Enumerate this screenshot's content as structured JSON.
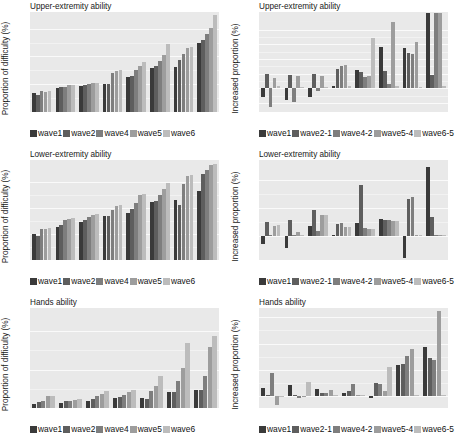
{
  "figure": {
    "panel_width": 229,
    "panel_height": 148,
    "series_colors_abs": [
      "#3a3a3a",
      "#5e5e5e",
      "#7e7e7e",
      "#9d9d9d",
      "#bcbcbc"
    ],
    "series_colors_diff": [
      "#3a3a3a",
      "#5e5e5e",
      "#7e7e7e",
      "#9d9d9d",
      "#bcbcbc"
    ],
    "plot_background": "#e9e9e9",
    "text_color": "#1a1a1a"
  },
  "chart_data": [
    {
      "id": "upper-extremity-proportion",
      "type": "bar",
      "title": "Upper-extremity ability",
      "xlabel": "",
      "ylabel": "Proportion of difficulty (%)",
      "ylim": [
        0,
        90
      ],
      "yticks": [
        0,
        25,
        50,
        75
      ],
      "grid": true,
      "legend_position": "bottom",
      "categories": [
        "50-55",
        "56-60",
        "61-65",
        "66-70",
        "71-75",
        "76-80",
        "81-85",
        "86-90"
      ],
      "series": [
        {
          "name": "wave1",
          "values": [
            17.0,
            22.0,
            23.5,
            25.0,
            31.5,
            39.5,
            40.5,
            62.0
          ]
        },
        {
          "name": "wave2",
          "values": [
            15.5,
            22.5,
            24.0,
            25.5,
            32.5,
            41.5,
            47.0,
            65.0
          ]
        },
        {
          "name": "wave4",
          "values": [
            18.5,
            22.5,
            25.5,
            35.0,
            37.5,
            45.5,
            52.0,
            70.0
          ]
        },
        {
          "name": "wave5",
          "values": [
            18.0,
            24.5,
            26.5,
            37.0,
            41.5,
            51.0,
            58.0,
            76.0
          ]
        },
        {
          "name": "wave6",
          "values": [
            18.5,
            24.5,
            26.5,
            37.5,
            45.0,
            61.0,
            58.5,
            87.0
          ]
        }
      ]
    },
    {
      "id": "upper-extremity-increase",
      "type": "bar",
      "title": "Upper-extremity ability",
      "xlabel": "",
      "ylabel": "Increased proportion (%)",
      "ylim": [
        -1.6,
        5.2
      ],
      "yticks": [
        -1,
        0,
        1,
        2,
        3,
        4
      ],
      "grid": true,
      "legend_position": "bottom",
      "categories": [
        "50-55",
        "56-60",
        "61-65",
        "66-70",
        "71-75",
        "76-80",
        "81-85",
        "86-90"
      ],
      "series": [
        {
          "name": "wave1",
          "values": [
            -0.55,
            -0.75,
            -0.6,
            0.15,
            1.25,
            2.85,
            2.75,
            5.15
          ]
        },
        {
          "name": "wave2-1",
          "values": [
            1.0,
            0.95,
            1.0,
            1.35,
            1.1,
            1.2,
            2.4,
            0.95
          ]
        },
        {
          "name": "wave4-2",
          "values": [
            -1.25,
            -0.95,
            -0.15,
            1.55,
            0.8,
            0.3,
            2.35,
            5.1
          ]
        },
        {
          "name": "wave5-4",
          "values": [
            0.7,
            0.85,
            0.85,
            1.6,
            0.85,
            4.55,
            3.15,
            5.15
          ]
        },
        {
          "name": "wave6-5",
          "values": [
            0.15,
            0.1,
            0.1,
            0.15,
            3.45,
            0.15,
            0.1,
            0.15
          ]
        }
      ]
    },
    {
      "id": "lower-extremity-proportion",
      "type": "bar",
      "title": "Lower-extremity ability",
      "xlabel": "",
      "ylabel": "Proportion of difficulty (%)",
      "ylim": [
        0,
        96
      ],
      "yticks": [
        0,
        25,
        50,
        75
      ],
      "grid": true,
      "legend_position": "bottom",
      "categories": [
        "50-55",
        "56-60",
        "61-65",
        "66-70",
        "71-75",
        "76-80",
        "81-85",
        "86-90"
      ],
      "series": [
        {
          "name": "wave1",
          "values": [
            25.0,
            32.0,
            36.5,
            42.5,
            45.5,
            55.5,
            58.0,
            66.5
          ]
        },
        {
          "name": "wave2",
          "values": [
            23.0,
            34.0,
            38.5,
            42.5,
            48.5,
            57.0,
            52.5,
            83.0
          ]
        },
        {
          "name": "wave4",
          "values": [
            29.5,
            38.5,
            41.5,
            48.0,
            55.0,
            62.0,
            72.5,
            86.5
          ]
        },
        {
          "name": "wave5",
          "values": [
            30.0,
            39.0,
            43.5,
            51.5,
            62.0,
            68.0,
            81.0,
            91.5
          ]
        },
        {
          "name": "wave6",
          "values": [
            30.5,
            40.0,
            44.0,
            52.5,
            63.0,
            73.5,
            81.5,
            92.0
          ]
        }
      ]
    },
    {
      "id": "lower-extremity-increase",
      "type": "bar",
      "title": "Lower-extremity ability",
      "xlabel": "",
      "ylabel": "Increased proportion (%)",
      "ylim": [
        -2.6,
        8.2
      ],
      "yticks": [
        0,
        3,
        6
      ],
      "grid": true,
      "legend_position": "bottom",
      "categories": [
        "50-55",
        "56-60",
        "61-65",
        "66-70",
        "71-75",
        "76-80",
        "81-85",
        "86-90"
      ],
      "series": [
        {
          "name": "wave1",
          "values": [
            -0.85,
            -1.25,
            1.1,
            0.15,
            1.4,
            1.8,
            -2.4,
            7.4
          ]
        },
        {
          "name": "wave2-1",
          "values": [
            1.55,
            1.75,
            2.75,
            1.25,
            5.5,
            1.7,
            4.0,
            2.1
          ]
        },
        {
          "name": "wave4-2",
          "values": [
            0.1,
            0.1,
            0.5,
            1.4,
            0.9,
            1.7,
            4.2,
            0.1
          ]
        },
        {
          "name": "wave5-4",
          "values": [
            1.1,
            0.45,
            2.3,
            1.0,
            0.8,
            1.65,
            0.1,
            0.1
          ]
        },
        {
          "name": "wave6-5",
          "values": [
            1.2,
            0.15,
            2.25,
            1.0,
            0.75,
            1.6,
            0.1,
            0.1
          ]
        }
      ]
    },
    {
      "id": "hands-proportion",
      "type": "bar",
      "title": "Hands ability",
      "xlabel": "",
      "ylabel": "Proportion of difficulty (%)",
      "ylim": [
        0,
        26
      ],
      "yticks": [
        0,
        10,
        20
      ],
      "grid": true,
      "legend_position": "bottom",
      "categories": [
        "50-55",
        "56-60",
        "61-65",
        "66-70",
        "71-75",
        "76-80",
        "81-85"
      ],
      "series": [
        {
          "name": "wave1",
          "values": [
            1.1,
            1.3,
            1.7,
            2.6,
            2.5,
            4.1,
            4.6
          ]
        },
        {
          "name": "wave2",
          "values": [
            1.6,
            1.7,
            2.4,
            2.8,
            2.3,
            4.2,
            4.6
          ]
        },
        {
          "name": "wave4",
          "values": [
            1.8,
            1.9,
            3.0,
            3.5,
            4.3,
            7.1,
            8.2
          ]
        },
        {
          "name": "wave5",
          "values": [
            3.2,
            2.2,
            3.6,
            4.2,
            5.7,
            10.3,
            15.8
          ]
        },
        {
          "name": "wave6",
          "values": [
            3.2,
            2.3,
            4.3,
            4.6,
            8.2,
            16.8,
            18.6
          ]
        }
      ]
    },
    {
      "id": "hands-increase",
      "type": "bar",
      "title": "Hands ability",
      "xlabel": "",
      "ylabel": "Increased proportion (%)",
      "ylim": [
        -0.45,
        3.35
      ],
      "yticks": [
        0,
        1,
        2,
        3
      ],
      "grid": true,
      "legend_position": "bottom",
      "categories": [
        "50-55",
        "56-60",
        "61-65",
        "66-70",
        "71-75",
        "76-80",
        "81-85"
      ],
      "series": [
        {
          "name": "wave1",
          "values": [
            0.3,
            0.42,
            0.27,
            0.13,
            -0.08,
            1.18,
            1.88
          ]
        },
        {
          "name": "wave2-1",
          "values": [
            0.04,
            0.04,
            0.13,
            0.18,
            0.52,
            1.22,
            1.45
          ]
        },
        {
          "name": "wave4-2",
          "values": [
            0.88,
            -0.06,
            0.13,
            0.45,
            0.48,
            1.52,
            1.38
          ]
        },
        {
          "name": "wave5-4",
          "values": [
            -0.32,
            0.02,
            0.22,
            0.04,
            0.18,
            1.78,
            3.22
          ]
        },
        {
          "name": "wave6-5",
          "values": [
            0.02,
            0.55,
            0.04,
            0.04,
            1.1,
            0.04,
            0.04
          ]
        }
      ]
    }
  ],
  "legends": [
    {
      "id": "legend-abs",
      "entries": [
        {
          "label": "wave1",
          "color": "#3a3a3a"
        },
        {
          "label": "wave2",
          "color": "#5e5e5e"
        },
        {
          "label": "wave4",
          "color": "#7e7e7e"
        },
        {
          "label": "wave5",
          "color": "#9d9d9d"
        },
        {
          "label": "wave6",
          "color": "#bcbcbc"
        }
      ]
    },
    {
      "id": "legend-diff",
      "entries": [
        {
          "label": "wave1",
          "color": "#3a3a3a"
        },
        {
          "label": "wave2-1",
          "color": "#5e5e5e"
        },
        {
          "label": "wave4-2",
          "color": "#7e7e7e"
        },
        {
          "label": "wave5-4",
          "color": "#9d9d9d"
        },
        {
          "label": "wave6-5",
          "color": "#bcbcbc"
        }
      ]
    }
  ]
}
